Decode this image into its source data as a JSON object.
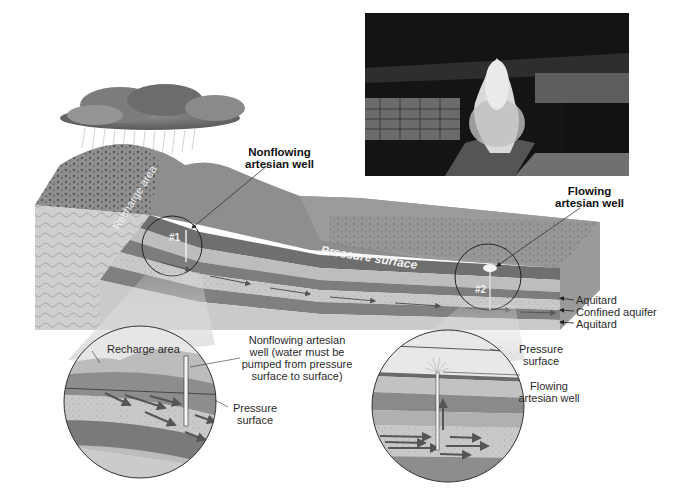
{
  "figure": {
    "type": "artesian-system-block-diagram",
    "color_mode": "grayscale"
  },
  "block_diagram": {
    "labels": {
      "recharge_area": "Recharge area",
      "pressure_surface": "Pressure surface",
      "nonflowing_well": "Nonflowing artesian well",
      "nonflowing_well_line1": "Nonflowing",
      "nonflowing_well_line2": "artesian well",
      "flowing_well_line1": "Flowing",
      "flowing_well_line2": "artesian well",
      "well_1_tag": "#1",
      "well_2_tag": "#2"
    },
    "layers": [
      {
        "label": "Aquitard"
      },
      {
        "label": "Confined aquifer"
      },
      {
        "label": "Aquitard"
      }
    ]
  },
  "photo": {
    "subject": "flowing artesian well fountain"
  },
  "inset_left": {
    "recharge_area": "Recharge area",
    "well_line1": "Nonflowing artesian",
    "well_line2": "well (water must be",
    "well_line3": "pumped from  pressure",
    "well_line4": "surface to surface)",
    "pressure_line1": "Pressure",
    "pressure_line2": "surface"
  },
  "inset_right": {
    "pressure_line1": "Pressure",
    "pressure_line2": "surface",
    "well_line1": "Flowing",
    "well_line2": "artesian well"
  }
}
